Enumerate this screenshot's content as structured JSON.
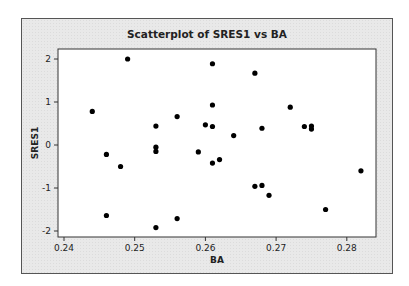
{
  "chart_data": {
    "type": "scatter",
    "title": "Scatterplot of SRES1 vs BA",
    "xlabel": "BA",
    "ylabel": "SRES1",
    "xlim": [
      0.2385,
      0.2855
    ],
    "ylim": [
      -2.2,
      2.2
    ],
    "xticks": [
      0.24,
      0.25,
      0.26,
      0.27,
      0.28
    ],
    "xtick_labels": [
      "0.24",
      "0.25",
      "0.26",
      "0.27",
      "0.28"
    ],
    "yticks": [
      -2,
      -1,
      0,
      1,
      2
    ],
    "ytick_labels": [
      "-2",
      "-1",
      "0",
      "1",
      "2"
    ],
    "grid": false,
    "legend": null,
    "points": [
      {
        "x": 0.244,
        "y": 0.78
      },
      {
        "x": 0.246,
        "y": -0.22
      },
      {
        "x": 0.246,
        "y": -1.64
      },
      {
        "x": 0.248,
        "y": -0.5
      },
      {
        "x": 0.249,
        "y": 2.0
      },
      {
        "x": 0.253,
        "y": 0.44
      },
      {
        "x": 0.253,
        "y": -0.05
      },
      {
        "x": 0.253,
        "y": -0.15
      },
      {
        "x": 0.253,
        "y": -1.92
      },
      {
        "x": 0.256,
        "y": 0.66
      },
      {
        "x": 0.256,
        "y": -1.71
      },
      {
        "x": 0.259,
        "y": -0.16
      },
      {
        "x": 0.26,
        "y": 0.47
      },
      {
        "x": 0.261,
        "y": 1.89
      },
      {
        "x": 0.261,
        "y": 0.93
      },
      {
        "x": 0.261,
        "y": 0.43
      },
      {
        "x": 0.261,
        "y": -0.42
      },
      {
        "x": 0.262,
        "y": -0.34
      },
      {
        "x": 0.264,
        "y": 0.22
      },
      {
        "x": 0.267,
        "y": 1.67
      },
      {
        "x": 0.267,
        "y": -0.96
      },
      {
        "x": 0.268,
        "y": 0.39
      },
      {
        "x": 0.268,
        "y": -0.94
      },
      {
        "x": 0.269,
        "y": -1.17
      },
      {
        "x": 0.272,
        "y": 0.88
      },
      {
        "x": 0.274,
        "y": 0.43
      },
      {
        "x": 0.275,
        "y": 0.44
      },
      {
        "x": 0.275,
        "y": 0.37
      },
      {
        "x": 0.277,
        "y": -1.5
      },
      {
        "x": 0.282,
        "y": -0.6
      }
    ],
    "marker_color": "#000000"
  }
}
